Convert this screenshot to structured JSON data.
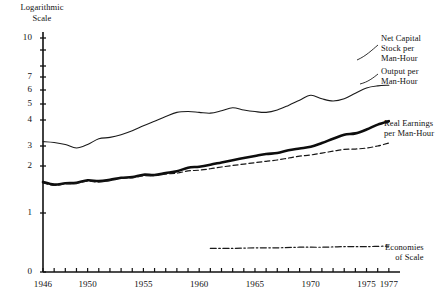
{
  "chart_data": {
    "type": "line",
    "title": "",
    "ylabel": "Logarithmic Scale",
    "xlabel": "",
    "scale": "log",
    "grid": false,
    "legend_position": "right-inline",
    "xlim": [
      1946,
      1978
    ],
    "ylim": [
      0,
      10
    ],
    "x_ticks": [
      1946,
      1950,
      1955,
      1960,
      1965,
      1970,
      1975,
      1977
    ],
    "x_tick_labels": [
      "1946",
      "1950",
      "1955",
      "1960",
      "1965",
      "1970",
      "1975",
      "1977"
    ],
    "y_ticks": [
      0,
      1,
      2,
      3,
      4,
      5,
      6,
      7,
      8,
      9,
      10
    ],
    "y_tick_labels": [
      "0",
      "1",
      "2",
      "3",
      "4",
      "5",
      "6",
      "7",
      "",
      "",
      "10"
    ],
    "series": [
      {
        "name": "Net Capital Stock per Man-Hour",
        "style": "thin-solid",
        "color": "#1a1a1a",
        "x": [
          1946,
          1947,
          1948,
          1949,
          1950,
          1951,
          1952,
          1953,
          1954,
          1955,
          1956,
          1957,
          1958,
          1959,
          1960,
          1961,
          1962,
          1963,
          1964,
          1965,
          1966,
          1967,
          1968,
          1969,
          1970,
          1971,
          1972,
          1973,
          1974,
          1975,
          1976,
          1977
        ],
        "values": [
          3.15,
          3.12,
          3.05,
          2.88,
          3.05,
          3.25,
          3.3,
          3.4,
          3.55,
          3.75,
          3.95,
          4.2,
          4.45,
          4.5,
          4.45,
          4.4,
          4.55,
          4.75,
          4.6,
          4.5,
          4.45,
          4.6,
          4.9,
          5.25,
          5.6,
          5.35,
          5.2,
          5.35,
          5.75,
          6.15,
          6.3,
          6.35
        ]
      },
      {
        "name": "Output per Man-Hour",
        "style": "thick-solid",
        "color": "#0d0d0d",
        "x": [
          1946,
          1947,
          1948,
          1949,
          1950,
          1951,
          1952,
          1953,
          1954,
          1955,
          1956,
          1957,
          1958,
          1959,
          1960,
          1961,
          1962,
          1963,
          1964,
          1965,
          1966,
          1967,
          1968,
          1969,
          1970,
          1971,
          1972,
          1973,
          1974,
          1975,
          1976,
          1977
        ],
        "values": [
          1.58,
          1.52,
          1.55,
          1.56,
          1.62,
          1.6,
          1.63,
          1.68,
          1.7,
          1.76,
          1.75,
          1.8,
          1.85,
          1.95,
          1.98,
          2.05,
          2.15,
          2.25,
          2.35,
          2.45,
          2.55,
          2.6,
          2.75,
          2.85,
          2.95,
          3.1,
          3.25,
          3.4,
          3.45,
          3.6,
          3.8,
          3.95
        ]
      },
      {
        "name": "Real Earnings per Man-Hour",
        "style": "dashed",
        "color": "#161616",
        "x": [
          1946,
          1947,
          1948,
          1949,
          1950,
          1951,
          1952,
          1953,
          1954,
          1955,
          1956,
          1957,
          1958,
          1959,
          1960,
          1961,
          1962,
          1963,
          1964,
          1965,
          1966,
          1967,
          1968,
          1969,
          1970,
          1971,
          1972,
          1973,
          1974,
          1975,
          1976,
          1977
        ],
        "values": [
          1.56,
          1.5,
          1.54,
          1.55,
          1.6,
          1.58,
          1.62,
          1.67,
          1.68,
          1.73,
          1.74,
          1.78,
          1.8,
          1.86,
          1.88,
          1.92,
          1.97,
          2.02,
          2.08,
          2.14,
          2.2,
          2.26,
          2.35,
          2.44,
          2.5,
          2.6,
          2.7,
          2.8,
          2.82,
          2.88,
          3.0,
          3.1
        ]
      },
      {
        "name": "Economies of Scale",
        "style": "dash-dot",
        "color": "#1a1a1a",
        "x": [
          1961,
          1963,
          1965,
          1967,
          1969,
          1971,
          1973,
          1975,
          1977
        ],
        "values": [
          0.4,
          0.4,
          0.41,
          0.41,
          0.42,
          0.42,
          0.43,
          0.43,
          0.44
        ]
      }
    ],
    "annotations": [
      {
        "name": "net-capital-label",
        "text_lines": [
          "Net Capital",
          "Stock per",
          "Man-Hour"
        ]
      },
      {
        "name": "output-label",
        "text_lines": [
          "Output per",
          "Man-Hour"
        ]
      },
      {
        "name": "real-earnings-label",
        "text_lines": [
          "Real Earnings",
          "per Man-Hour"
        ]
      },
      {
        "name": "economies-label",
        "text_lines": [
          "Economies",
          "of Scale"
        ]
      }
    ]
  },
  "axis": {
    "y_title_line1": "Logarithmic",
    "y_title_line2": "Scale"
  },
  "labels": {
    "net_capital_l1": "Net Capital",
    "net_capital_l2": "Stock per",
    "net_capital_l3": "Man-Hour",
    "output_l1": "Output per",
    "output_l2": "Man-Hour",
    "earnings_l1": "Real Earnings",
    "earnings_l2": "per Man-Hour",
    "econ_l1": "Economies",
    "econ_l2": "of Scale"
  },
  "colors": {
    "ink": "#111111",
    "background": "#ffffff"
  }
}
